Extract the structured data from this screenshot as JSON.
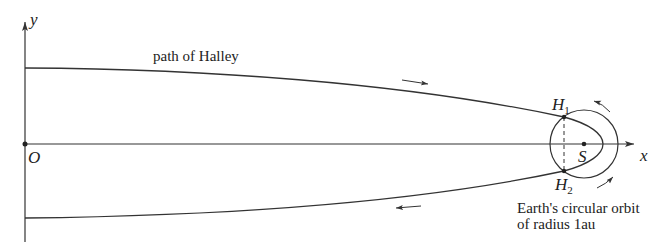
{
  "diagram": {
    "axes": {
      "x_label": "x",
      "y_label": "y",
      "origin_label": "O"
    },
    "labels": {
      "path": "path of Halley",
      "sun": "S",
      "h1_main": "H",
      "h1_sub": "1",
      "h2_main": "H",
      "h2_sub": "2",
      "earth_orbit_line1": "Earth's circular orbit",
      "earth_orbit_line2": "of radius 1au"
    },
    "colors": {
      "line": "#333333",
      "text": "#222222",
      "background": "#ffffff"
    }
  }
}
